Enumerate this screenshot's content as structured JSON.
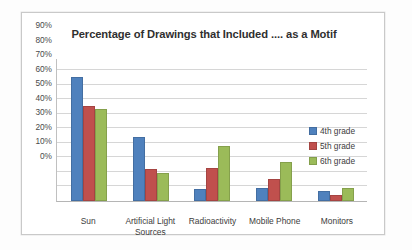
{
  "chart_data": {
    "type": "bar",
    "title": "Percentage of Drawings that Included .... as a Motif",
    "xlabel": "",
    "ylabel": "",
    "categories": [
      "Sun",
      "Artificial Light Sources",
      "Radioactivity",
      "Mobile Phone",
      "Monitors"
    ],
    "series": [
      {
        "name": "4th grade",
        "color": "#4F81BD",
        "values": [
          85,
          44,
          8,
          9,
          7
        ]
      },
      {
        "name": "5th grade",
        "color": "#C0504D",
        "values": [
          65,
          22,
          23,
          15,
          4
        ]
      },
      {
        "name": "6th grade",
        "color": "#9BBB59",
        "values": [
          63,
          19,
          38,
          27,
          9
        ]
      }
    ],
    "ylim": [
      0,
      90
    ],
    "ytick_values": [
      90,
      80,
      70,
      60,
      50,
      40,
      30,
      20,
      10,
      0
    ],
    "ytick_labels": [
      "90%",
      "80%",
      "70%",
      "60%",
      "50%",
      "40%",
      "30%",
      "20%",
      "10%",
      "0%"
    ],
    "grid": true,
    "grid_axis": "y",
    "legend_position": "right",
    "grid_color": "#d6d6d6",
    "axis_color": "#b5b5b5",
    "frame_color": "#c9c9c9",
    "background": "#ffffff"
  },
  "legend": {
    "entries": [
      {
        "label": "4th grade",
        "color": "#4F81BD"
      },
      {
        "label": "5th grade",
        "color": "#C0504D"
      },
      {
        "label": "6th grade",
        "color": "#9BBB59"
      }
    ]
  }
}
